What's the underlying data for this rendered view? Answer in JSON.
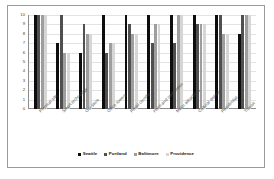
{
  "chart_data": {
    "type": "bar",
    "title": "",
    "subtitle": "",
    "xlabel": "",
    "ylabel": "",
    "ylim": [
      0,
      10
    ],
    "grid": true,
    "legend_position": "bottom",
    "yticks": [
      "10",
      "9",
      "8",
      "7",
      "6",
      "5",
      "4",
      "3",
      "2",
      "1",
      "0"
    ],
    "categories": [
      "Physical site",
      "Smart technology",
      "Our store",
      "Office towers",
      "Retail corridor",
      "Hotel and convention",
      "Major attractions",
      "Cultural district",
      "Residential",
      "Transit"
    ],
    "series": [
      {
        "name": "Seattle",
        "color": "#0d0d0d",
        "values": [
          10,
          7,
          6,
          10,
          10,
          10,
          10,
          10,
          10,
          8
        ]
      },
      {
        "name": "Portland",
        "color": "#4f4f4f",
        "values": [
          10,
          10,
          9,
          6,
          9,
          7,
          7,
          9,
          10,
          10
        ]
      },
      {
        "name": "Baltimore",
        "color": "#9e9e9e",
        "values": [
          10,
          6,
          8,
          7,
          8,
          9,
          10,
          9,
          8,
          10
        ]
      },
      {
        "name": "Providence",
        "color": "#d6d6d6",
        "values": [
          10,
          6,
          8,
          7,
          8,
          9,
          10,
          9,
          8,
          10
        ]
      }
    ]
  },
  "legend": {
    "items": [
      {
        "label": "Seattle",
        "color": "#0d0d0d"
      },
      {
        "label": "Portland",
        "color": "#4f4f4f"
      },
      {
        "label": "Baltimore",
        "color": "#9e9e9e"
      },
      {
        "label": "Providence",
        "color": "#d6d6d6"
      }
    ]
  },
  "colors": {
    "frame_border": "#9a9a9a",
    "axis": "#8c8c8c",
    "gridline": "#e3e3e3",
    "background": "#ffffff"
  }
}
